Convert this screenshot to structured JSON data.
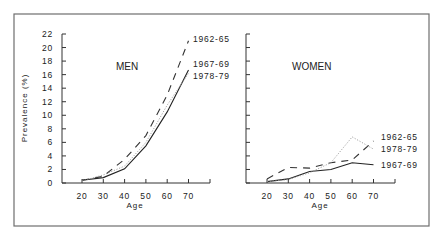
{
  "chart_data": {
    "type": "line",
    "ylabel": "Prevalence (%)",
    "xlabel": "Age",
    "ylim": [
      0,
      22
    ],
    "yticks": [
      "0",
      "2",
      "4",
      "6",
      "8",
      "10",
      "12",
      "14",
      "16",
      "18",
      "20",
      "22"
    ],
    "xticks": [
      "20",
      "30",
      "40",
      "50",
      "60",
      "70"
    ],
    "x": [
      20,
      30,
      40,
      50,
      60,
      70
    ],
    "grid": false,
    "panels": [
      {
        "title": "MEN",
        "series": [
          {
            "name": "1962-65",
            "style": "dashed",
            "values": [
              0.4,
              1.0,
              3.5,
              7.0,
              13.0,
              21.0
            ]
          },
          {
            "name": "1967-69",
            "style": "solid",
            "values": [
              0.4,
              0.8,
              2.1,
              5.5,
              10.5,
              16.7
            ]
          },
          {
            "name": "1978-79",
            "style": "dotted",
            "values": [
              0.3,
              1.2,
              2.5,
              6.0,
              11.5,
              16.2
            ]
          }
        ],
        "labels": [
          "1962-65",
          "1967-69",
          "1978-79"
        ]
      },
      {
        "title": "WOMEN",
        "series": [
          {
            "name": "1962-65",
            "style": "dashed",
            "values": [
              0.6,
              2.3,
              2.2,
              3.0,
              3.4,
              6.2
            ]
          },
          {
            "name": "1967-69",
            "style": "solid",
            "values": [
              0.2,
              0.6,
              1.7,
              2.0,
              3.0,
              2.7
            ]
          },
          {
            "name": "1978-79",
            "style": "dotted",
            "values": [
              0.2,
              0.5,
              1.5,
              3.0,
              6.8,
              5.0
            ]
          }
        ],
        "labels": [
          "1962-65",
          "1978-79",
          "1967-69"
        ]
      }
    ]
  }
}
